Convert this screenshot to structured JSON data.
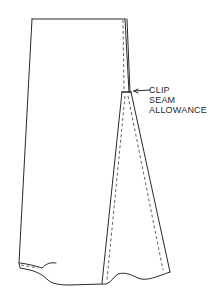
{
  "diagram": {
    "type": "sewing-illustration",
    "annotation": {
      "lines": [
        "CLIP",
        "SEAM",
        "ALLOWANCE"
      ],
      "pointer": "arrow-left"
    },
    "colors": {
      "ink": "#2a2a2a",
      "background": "#ffffff"
    }
  }
}
